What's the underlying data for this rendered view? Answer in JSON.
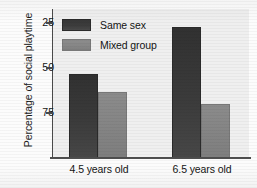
{
  "chart_data": {
    "type": "bar",
    "title": "",
    "subtitle": "",
    "xlabel": "",
    "ylabel": "Percentage of social playtime",
    "categories": [
      "4.5 years old",
      "6.5 years old"
    ],
    "series": [
      {
        "name": "Same sex",
        "values": [
          47,
          73
        ],
        "color": "#3b3b3b"
      },
      {
        "name": "Mixed group",
        "values": [
          37,
          30
        ],
        "color": "#858585"
      }
    ],
    "ylim": [
      0,
      83
    ],
    "yticks": [
      25,
      50,
      75
    ],
    "ytick_labels": [
      "25",
      "50",
      "75"
    ],
    "grid": false,
    "legend_position": "upper-left-inside",
    "plot_background": "#efefef",
    "axis_color": "#4a4a4a"
  },
  "axis": {
    "y_title": "Percentage of social playtime",
    "ticks": [
      {
        "label": "75",
        "value": 75
      },
      {
        "label": "50",
        "value": 50
      },
      {
        "label": "25",
        "value": 25
      }
    ]
  },
  "legend": {
    "items": [
      {
        "label": "Same sex",
        "color": "#3b3b3b"
      },
      {
        "label": "Mixed group",
        "color": "#858585"
      }
    ]
  },
  "groups": [
    {
      "label": "4.5 years old",
      "bars": [
        {
          "series": "Same sex",
          "value": 47
        },
        {
          "series": "Mixed group",
          "value": 37
        }
      ]
    },
    {
      "label": "6.5 years old",
      "bars": [
        {
          "series": "Same sex",
          "value": 73
        },
        {
          "series": "Mixed group",
          "value": 30
        }
      ]
    }
  ]
}
